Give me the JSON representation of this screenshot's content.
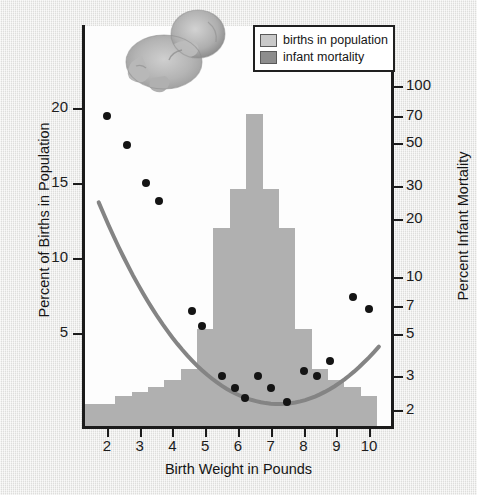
{
  "chart_data": {
    "type": "bar",
    "title": "",
    "xlabel": "Birth Weight in Pounds",
    "ylabel": "Percent of Births in Population",
    "y2label": "Percent Infant Mortality",
    "xlim": [
      1.3,
      10.7
    ],
    "ylim": [
      0,
      22
    ],
    "y2lim": [
      1.6,
      130
    ],
    "y2_scale": "log",
    "grid": false,
    "legend_position": "top-right",
    "x_ticks": [
      2,
      3,
      4,
      5,
      6,
      7,
      8,
      9,
      10
    ],
    "y_ticks": [
      5,
      10,
      15,
      20
    ],
    "y2_ticks": [
      2,
      3,
      5,
      7,
      10,
      20,
      30,
      50,
      70,
      100
    ],
    "series": [
      {
        "name": "births in population",
        "type": "bar",
        "axis": "left",
        "color": "#b0b0b0",
        "bin_width": 0.5,
        "x": [
          1.5,
          2.0,
          2.5,
          3.0,
          3.5,
          4.0,
          4.5,
          5.0,
          5.5,
          6.0,
          6.5,
          7.0,
          7.5,
          8.0,
          8.5,
          9.0,
          9.5,
          10.0
        ],
        "values": [
          0.3,
          0.3,
          0.8,
          1.1,
          1.4,
          1.9,
          2.6,
          5.3,
          12.0,
          14.6,
          19.6,
          14.6,
          12.0,
          5.3,
          2.6,
          1.9,
          1.4,
          0.8
        ]
      },
      {
        "name": "infant mortality",
        "type": "scatter",
        "axis": "right",
        "color": "#141414",
        "x": [
          2.0,
          2.6,
          3.2,
          3.6,
          4.6,
          4.9,
          5.5,
          5.9,
          6.2,
          6.6,
          7.0,
          7.5,
          8.0,
          8.4,
          8.8,
          9.5,
          10.0
        ],
        "values": [
          70.0,
          49.0,
          31.0,
          25.0,
          6.6,
          5.5,
          3.0,
          2.6,
          2.3,
          3.0,
          2.6,
          2.2,
          3.2,
          3.0,
          3.6,
          7.8,
          6.8
        ]
      },
      {
        "name": "infant mortality trend",
        "type": "line",
        "axis": "right",
        "color": "#808080",
        "note": "smooth U-shaped fitted curve through the mortality points"
      }
    ]
  },
  "axes": {
    "left": {
      "title": "Percent of Births in Population",
      "tick_labels": [
        "20",
        "15",
        "10",
        "5"
      ]
    },
    "right": {
      "title": "Percent Infant Mortality",
      "tick_labels": [
        "100",
        "70",
        "50",
        "30",
        "20",
        "10",
        "7",
        "5",
        "3",
        "2"
      ]
    },
    "bottom": {
      "title": "Birth Weight in Pounds",
      "tick_labels": [
        "2",
        "3",
        "4",
        "5",
        "6",
        "7",
        "8",
        "9",
        "10"
      ]
    }
  },
  "legend": {
    "items": [
      {
        "label": "births in population",
        "color": "#c9c9c9"
      },
      {
        "label": "infant mortality",
        "color": "#8d8d8d"
      }
    ]
  },
  "illustration": {
    "name": "fetus-illustration",
    "alt": "grayscale drawing of a curled newborn infant"
  }
}
